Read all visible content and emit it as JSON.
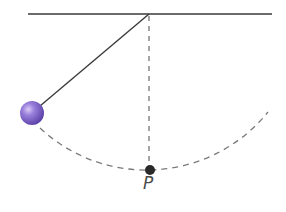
{
  "diagram": {
    "type": "pendulum",
    "ceiling": {
      "x1": 28,
      "x2": 272,
      "y": 14,
      "color": "#3a3a3a"
    },
    "pivot": {
      "x": 149,
      "y": 14
    },
    "string": {
      "x2": 32,
      "y2": 112,
      "color": "#3a3a3a"
    },
    "bob": {
      "cx": 32,
      "cy": 113,
      "r": 12,
      "color": "#8a6ed0",
      "highlight": "#c9b8f0",
      "shadow": "#5e44a8"
    },
    "vertical_dashed": {
      "x": 149,
      "y1": 14,
      "y2": 168,
      "color": "#6a6a6a"
    },
    "arc": {
      "color": "#7a7a7a",
      "radius": 156
    },
    "point_p": {
      "cx": 150,
      "cy": 170,
      "r": 5,
      "color": "#2a2a2a",
      "label": "P"
    }
  }
}
